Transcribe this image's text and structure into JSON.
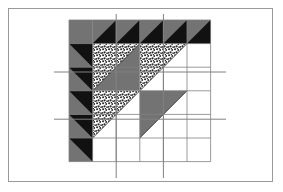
{
  "figure": {
    "kind": "quilt-block-diagram",
    "title": "",
    "frame": {
      "x": 8,
      "y": 8,
      "width": 265,
      "height": 174,
      "border_color": "#9a9a9a",
      "border_width": 1.5,
      "background": "#ffffff"
    }
  },
  "palette": {
    "gray": "#737373",
    "black": "#111111",
    "white": "#ffffff",
    "stipple_dot": "#2b2b2b",
    "stipple_bg": "#ffffff",
    "grid_line": "#808080",
    "outline": "#3a3a3a"
  },
  "grid": {
    "origin_x": 69,
    "origin_y": 20,
    "cell": 23.6,
    "columns": 6,
    "rows": 6,
    "total_width": 141.6,
    "total_height": 141.6,
    "line_color": "#808080",
    "line_width": 0.8,
    "extended_lines": {
      "vertical_x": [
        116.2,
        163.4
      ],
      "vertical_top": 14,
      "vertical_bottom": 178,
      "horizontal_y": [
        72.0,
        119.2
      ],
      "horizontal_left": 54,
      "horizontal_right": 226
    }
  },
  "border_units": {
    "label": "sawtooth border",
    "corner": {
      "row": 0,
      "col": 0,
      "fill": "gray"
    },
    "top_row": {
      "label": "top sawtooth row",
      "cells": [
        1,
        2,
        3,
        4,
        5
      ],
      "base_fill": "gray",
      "triangle_fill": "black",
      "triangle_corner": "lower-left"
    },
    "left_column": {
      "label": "left sawtooth column",
      "cells": [
        1,
        2,
        3,
        4,
        5
      ],
      "base_fill": "gray",
      "triangle_fill": "black",
      "triangle_corner": "upper-right"
    }
  },
  "quadrants": [
    {
      "name": "upper-left-quadrant",
      "col": 1,
      "row": 1,
      "span": 2,
      "upper_left_fill": "stipple",
      "lower_right_fill": "gray",
      "diagonal": "anti"
    },
    {
      "name": "upper-right-quadrant",
      "col": 3,
      "row": 1,
      "span": 2,
      "upper_left_fill": "stipple",
      "lower_right_fill": "white",
      "diagonal": "anti"
    },
    {
      "name": "lower-left-quadrant",
      "col": 1,
      "row": 3,
      "span": 2,
      "upper_left_fill": "stipple",
      "lower_right_fill": "white",
      "diagonal": "anti"
    },
    {
      "name": "lower-right-quadrant",
      "col": 3,
      "row": 3,
      "span": 2,
      "upper_left_fill": "gray",
      "lower_right_fill": "white",
      "diagonal": "anti"
    }
  ],
  "legend": {
    "present": false,
    "entries": []
  },
  "annotations": {
    "present": false,
    "items": []
  }
}
